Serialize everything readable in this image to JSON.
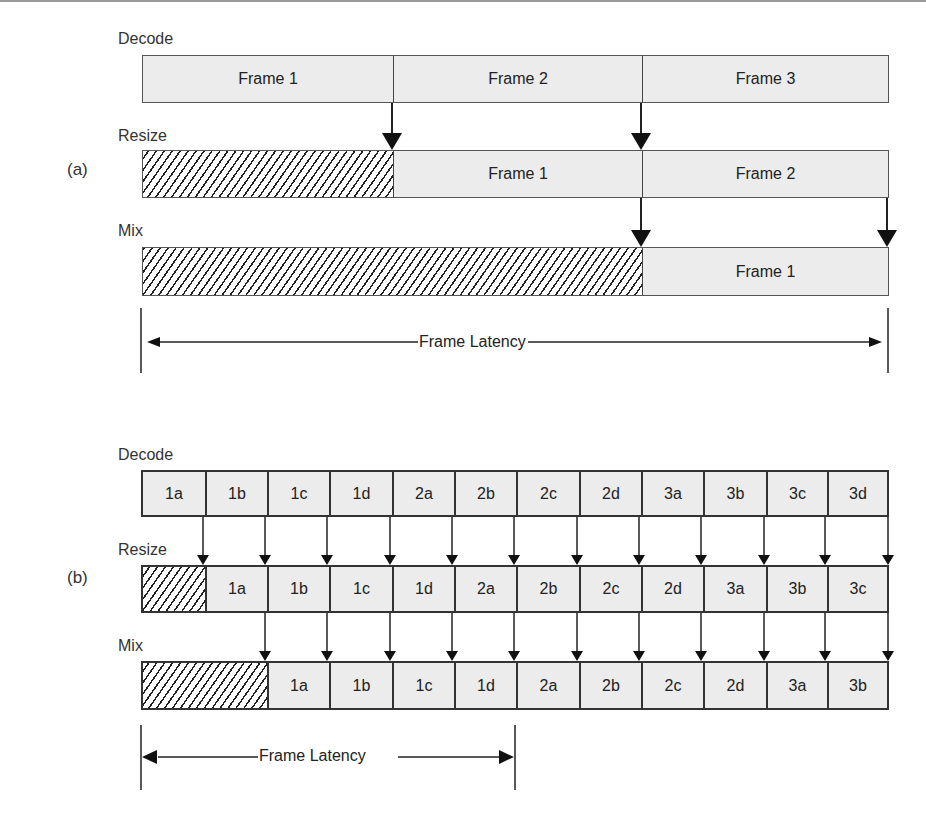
{
  "part_a": {
    "label": "(a)",
    "rows": [
      {
        "name": "Decode",
        "cells": [
          "Frame 1",
          "Frame 2",
          "Frame 3"
        ]
      },
      {
        "name": "Resize",
        "cells": [
          "",
          "Frame 1",
          "Frame 2"
        ]
      },
      {
        "name": "Mix",
        "cells": [
          "",
          "Frame 1"
        ]
      }
    ],
    "latency_label": "Frame Latency"
  },
  "part_b": {
    "label": "(b)",
    "rows": [
      {
        "name": "Decode",
        "cells": [
          "1a",
          "1b",
          "1c",
          "1d",
          "2a",
          "2b",
          "2c",
          "2d",
          "3a",
          "3b",
          "3c",
          "3d"
        ]
      },
      {
        "name": "Resize",
        "cells": [
          "",
          "1a",
          "1b",
          "1c",
          "1d",
          "2a",
          "2b",
          "2c",
          "2d",
          "3a",
          "3b",
          "3c"
        ]
      },
      {
        "name": "Mix",
        "cells": [
          "",
          "1a",
          "1b",
          "1c",
          "1d",
          "2a",
          "2b",
          "2c",
          "2d",
          "3a",
          "3b"
        ]
      }
    ],
    "latency_label": "Frame Latency"
  },
  "colors": {
    "cell_fill": "#ececec",
    "stroke": "#333333",
    "hatch": "#222222"
  }
}
